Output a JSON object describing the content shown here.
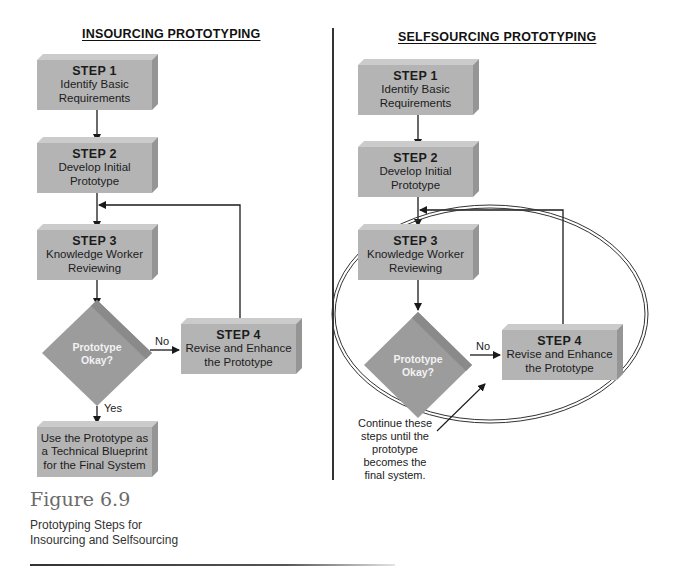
{
  "figure": {
    "number": "Figure 6.9",
    "caption_lines": [
      "Prototyping Steps for",
      "Insourcing and Selfsourcing"
    ]
  },
  "insourcing": {
    "title": "INSOURCING PROTOTYPING",
    "steps": [
      {
        "label": "STEP 1",
        "lines": [
          "Identify Basic",
          "Requirements"
        ]
      },
      {
        "label": "STEP 2",
        "lines": [
          "Develop Initial",
          "Prototype"
        ]
      },
      {
        "label": "STEP 3",
        "lines": [
          "Knowledge Worker",
          "Reviewing"
        ]
      },
      {
        "label": "STEP 4",
        "lines": [
          "Revise and Enhance",
          "the Prototype"
        ]
      }
    ],
    "decision": {
      "lines": [
        "Prototype",
        "Okay?"
      ],
      "no_label": "No",
      "yes_label": "Yes"
    },
    "final": {
      "lines": [
        "Use the Prototype as",
        "a Technical Blueprint",
        "for the Final System"
      ]
    }
  },
  "selfsourcing": {
    "title": "SELFSOURCING PROTOTYPING",
    "steps": [
      {
        "label": "STEP 1",
        "lines": [
          "Identify Basic",
          "Requirements"
        ]
      },
      {
        "label": "STEP 2",
        "lines": [
          "Develop Initial",
          "Prototype"
        ]
      },
      {
        "label": "STEP 3",
        "lines": [
          "Knowledge Worker",
          "Reviewing"
        ]
      },
      {
        "label": "STEP 4",
        "lines": [
          "Revise and Enhance",
          "the Prototype"
        ]
      }
    ],
    "decision": {
      "lines": [
        "Prototype",
        "Okay?"
      ],
      "no_label": "No"
    },
    "note_lines": [
      "Continue these",
      "steps until the",
      "prototype",
      "becomes the",
      "final system."
    ]
  },
  "colors": {
    "box_front": "#b4b4b4",
    "box_top": "#cbcbcb",
    "box_side": "#959595",
    "diamond": "#9c9c9c",
    "line": "#1a1a1a"
  }
}
